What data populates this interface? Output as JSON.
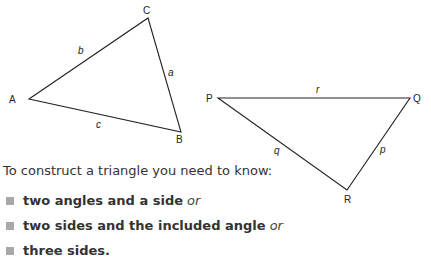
{
  "triangle_abc": {
    "vertices": {
      "A": "A",
      "B": "B",
      "C": "C"
    },
    "sides": {
      "a": "a",
      "b": "b",
      "c": "c"
    }
  },
  "triangle_pqr": {
    "vertices": {
      "P": "P",
      "Q": "Q",
      "R": "R"
    },
    "sides": {
      "p": "p",
      "q": "q",
      "r": "r"
    }
  },
  "text": {
    "intro": "To construct a triangle you need to know:",
    "items": [
      {
        "bold": "two angles and a side",
        "suffix": "or"
      },
      {
        "bold": "two sides and the included angle",
        "suffix": "or"
      },
      {
        "bold": "three sides.",
        "suffix": ""
      }
    ]
  },
  "colors": {
    "bullet": "#a8a8a8",
    "line": "#222222"
  }
}
